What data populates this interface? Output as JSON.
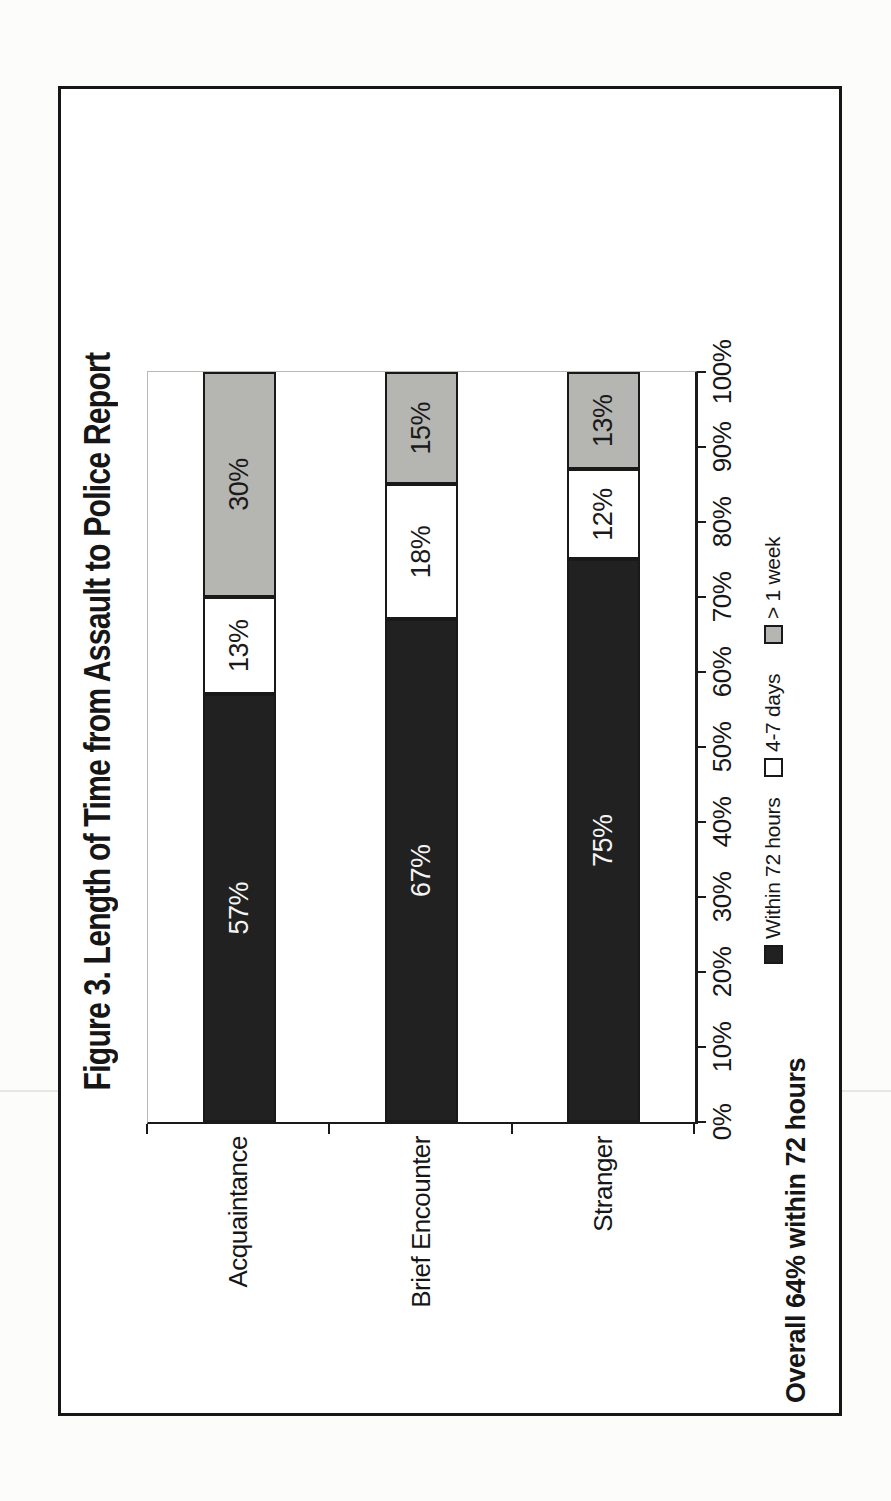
{
  "figure": {
    "title": "Figure 3. Length of Time from Assault to Police Report",
    "note": "Overall 64% within 72 hours"
  },
  "chart_data": {
    "type": "bar",
    "subtype": "stacked-100pct-horizontal",
    "page_orientation": "chart rotated 90deg counter-clockwise on portrait page",
    "title": "Figure 3. Length of Time from Assault to Police Report",
    "annotation": "Overall 64% within 72 hours",
    "categories": [
      "Acquaintance",
      "Brief Encounter",
      "Stranger"
    ],
    "series": [
      {
        "name": "Within 72 hours",
        "values": [
          57,
          67,
          75
        ],
        "labels": [
          "57%",
          "67%",
          "75%"
        ],
        "fill": "#212121",
        "label_color": "#f4f4f2"
      },
      {
        "name": "4-7 days",
        "values": [
          13,
          18,
          12
        ],
        "labels": [
          "13%",
          "18%",
          "12%"
        ],
        "fill": "#ffffff",
        "label_color": "#1a1a1a"
      },
      {
        "name": "> 1 week",
        "values": [
          30,
          15,
          13
        ],
        "labels": [
          "30%",
          "15%",
          "13%"
        ],
        "fill": "#b5b5b2",
        "label_color": "#1a1a1a"
      }
    ],
    "value_axis": {
      "min": 0,
      "max": 100,
      "tick_step": 10,
      "tick_labels": [
        "0%",
        "10%",
        "20%",
        "30%",
        "40%",
        "50%",
        "60%",
        "70%",
        "80%",
        "90%",
        "100%"
      ]
    },
    "legend": [
      {
        "label": "Within 72 hours",
        "fill": "#212121"
      },
      {
        "label": "4-7 days",
        "fill": "#ffffff"
      },
      {
        "label": "> 1 week",
        "fill": "#b5b5b2"
      }
    ],
    "gridlines": "none",
    "legend_position": "bottom"
  }
}
